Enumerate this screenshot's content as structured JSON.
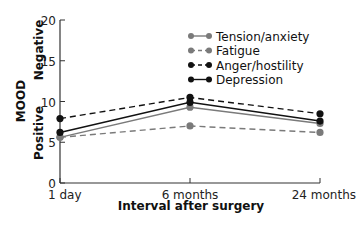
{
  "chart_data": {
    "type": "line",
    "title": "",
    "xlabel": "Interval after surgery",
    "ylabel": "MOOD",
    "ylabel_annotations": {
      "top": "Negative",
      "bottom": "Positive"
    },
    "categories": [
      "1 day",
      "6 months",
      "24 months"
    ],
    "ylim": [
      0,
      20
    ],
    "yticks": [
      0,
      5,
      10,
      15,
      20
    ],
    "grid": false,
    "legend_position": "upper right",
    "series": [
      {
        "name": "Tension/anxiety",
        "values": [
          5.6,
          9.3,
          7.3
        ],
        "color": "#7a7a7a",
        "dash": "solid"
      },
      {
        "name": "Fatigue",
        "values": [
          5.6,
          7.0,
          6.2
        ],
        "color": "#7a7a7a",
        "dash": "dashed"
      },
      {
        "name": "Anger/hostility",
        "values": [
          7.9,
          10.5,
          8.5
        ],
        "color": "#111111",
        "dash": "dashed"
      },
      {
        "name": "Depression",
        "values": [
          6.2,
          9.9,
          7.6
        ],
        "color": "#111111",
        "dash": "solid"
      }
    ]
  }
}
